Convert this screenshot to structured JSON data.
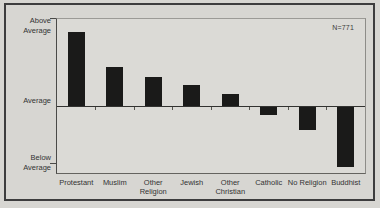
{
  "figure": {
    "y_axis_labels": {
      "above": "Above\nAverage",
      "average": "Average",
      "below": "Below\nAverage"
    },
    "annotation": "N=771"
  },
  "chart_data": {
    "type": "bar",
    "title": "",
    "categories": [
      "Protestant",
      "Muslim",
      "Other\nReligion",
      "Jewish",
      "Other\nChristian",
      "Catholic",
      "No Religion",
      "Buddhist"
    ],
    "values": [
      0.85,
      0.45,
      0.33,
      0.24,
      0.14,
      -0.09,
      -0.26,
      -0.69
    ],
    "value_unit": "relative deviation from sample average (1.0 = 'Above Average' axis tick)",
    "baseline_label": "Average",
    "y_tick_labels": [
      "Above Average",
      "Average",
      "Below Average"
    ],
    "annotation": "N=771",
    "bar_color": "#1a1a19",
    "background_color": "#d7d6d2",
    "ylim": [
      -0.77,
      1.0
    ],
    "legend": false,
    "grid": false
  }
}
